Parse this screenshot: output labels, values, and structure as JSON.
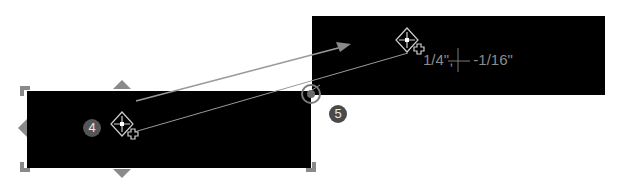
{
  "canvas": {
    "background": "#ffffff",
    "shape_fill": "#000000",
    "handle_color": "#8a8a8a",
    "guide_color": "#9a9a9a"
  },
  "shapes": [
    {
      "id": "original",
      "label": "original-rectangle"
    },
    {
      "id": "moved",
      "label": "moved-rectangle"
    }
  ],
  "badges": {
    "step4": "4",
    "step5": "5"
  },
  "cursor": {
    "offset_readout": "1/4\", ⊹ -1/16\""
  },
  "readout": {
    "x_offset": "1/4\"",
    "separator": ",",
    "y_offset": "-1/16\""
  },
  "icons": {
    "move": "move-cursor-icon",
    "copy": "copy-plus-icon",
    "snap": "snap-point-icon",
    "crosshair": "crosshair-icon"
  }
}
